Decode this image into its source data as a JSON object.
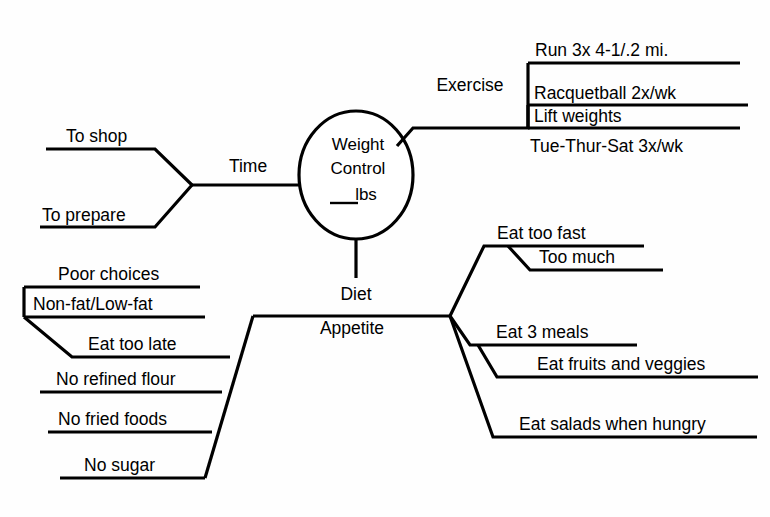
{
  "diagram": {
    "background_color": "#fefefe",
    "line_color": "#000000",
    "text_color": "#000000",
    "center": {
      "line1": "Weight",
      "line2": "Control",
      "line3": "lbs",
      "blank_prefix": "____"
    },
    "branches": {
      "exercise": {
        "label": "Exercise",
        "items": [
          "Run 3x 4-1/.2 mi.",
          "Racquetball 2x/wk",
          "Lift weights",
          "Tue-Thur-Sat 3x/wk"
        ]
      },
      "time": {
        "label": "Time",
        "items": [
          "To shop",
          "To prepare"
        ]
      },
      "diet": {
        "label": "Diet"
      },
      "appetite": {
        "label": "Appetite",
        "right_groups": [
          {
            "items": [
              "Eat too fast",
              "Too much"
            ]
          },
          {
            "items": [
              "Eat 3 meals",
              "Eat fruits and veggies"
            ]
          },
          {
            "items": [
              "Eat salads when hungry"
            ]
          }
        ],
        "left_groups": [
          {
            "items": [
              "Poor choices",
              "Non-fat/Low-fat",
              "Eat too late"
            ]
          },
          {
            "items": [
              "No refined flour",
              "No fried foods",
              "No sugar"
            ]
          }
        ]
      }
    },
    "labels": {
      "exercise": "Exercise",
      "time": "Time",
      "diet": "Diet",
      "appetite": "Appetite",
      "run": "Run 3x 4-1/.2 mi.",
      "racquetball": "Racquetball 2x/wk",
      "lift_weights": "Lift weights",
      "tue_thur_sat": "Tue-Thur-Sat 3x/wk",
      "to_shop": "To shop",
      "to_prepare": "To prepare",
      "eat_too_fast": "Eat too fast",
      "too_much": "Too much",
      "eat_3_meals": "Eat 3 meals",
      "eat_fruits": "Eat fruits and veggies",
      "eat_salads": "Eat salads when hungry",
      "poor_choices": "Poor choices",
      "non_fat": "Non-fat/Low-fat",
      "eat_too_late": "Eat too late",
      "no_refined_flour": "No refined flour",
      "no_fried_foods": "No fried foods",
      "no_sugar": "No sugar"
    }
  }
}
